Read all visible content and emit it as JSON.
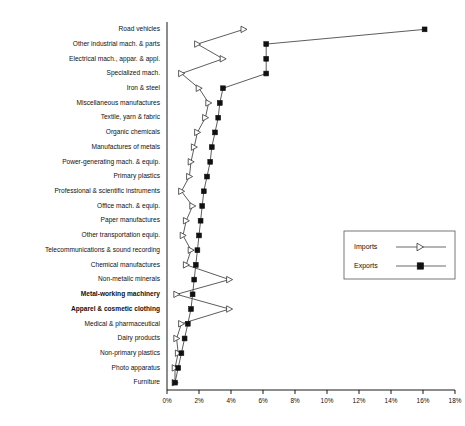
{
  "chart_data": {
    "type": "line",
    "orientation": "horizontal",
    "title": "",
    "xlabel": "",
    "ylabel": "",
    "xlim": [
      0,
      18
    ],
    "xunit": "%",
    "grid": false,
    "legend_position": "middle-right",
    "tick_labels": [
      "0%",
      "2%",
      "4%",
      "6%",
      "8%",
      "10%",
      "12%",
      "14%",
      "16%",
      "18%"
    ],
    "tick_values": [
      0,
      2,
      4,
      6,
      8,
      10,
      12,
      14,
      16,
      18
    ],
    "categories": [
      "Road vehicles",
      "Other industrial mach. & parts",
      "Electrical mach., appar. & appl.",
      "Specialized mach.",
      "Iron & steel",
      "Miscellaneous manufactures",
      "Textile, yarn & fabric",
      "Organic chemicals",
      "Manufactures of metals",
      "Power-generating mach. & equip.",
      "Primary plastics",
      "Professional & scientific instruments",
      "Office mach. & equip.",
      "Paper manufactures",
      "Other transportation equip.",
      "Telecommunications & sound recording",
      "Chemical manufactures",
      "Non-metalic minerals",
      "Metal-working machinery",
      "Apparel & cosmetic clothing",
      "Medical & pharmaceutical",
      "Dairy products",
      "Non-primary plastics",
      "Photo apparatus",
      "Furniture"
    ],
    "emphasized_categories": [
      "Metal-working machinery",
      "Apparel & cosmetic clothing"
    ],
    "series": [
      {
        "name": "Imports",
        "marker": "open-triangle-right",
        "values": [
          4.8,
          1.9,
          3.5,
          0.9,
          2.0,
          2.6,
          2.4,
          1.9,
          1.7,
          1.5,
          1.4,
          0.9,
          1.6,
          1.2,
          1.0,
          1.5,
          1.2,
          3.9,
          0.6,
          3.9,
          0.9,
          0.6,
          0.7,
          0.5,
          0.5
        ]
      },
      {
        "name": "Exports",
        "marker": "filled-square",
        "values": [
          16.1,
          6.2,
          6.2,
          6.2,
          3.5,
          3.3,
          3.2,
          3.0,
          2.8,
          2.7,
          2.5,
          2.3,
          2.2,
          2.1,
          2.0,
          1.9,
          1.8,
          1.7,
          1.6,
          1.5,
          1.3,
          1.1,
          0.9,
          0.7,
          0.5
        ]
      }
    ]
  },
  "legend": {
    "imports_label": "Imports",
    "exports_label": "Exports"
  }
}
